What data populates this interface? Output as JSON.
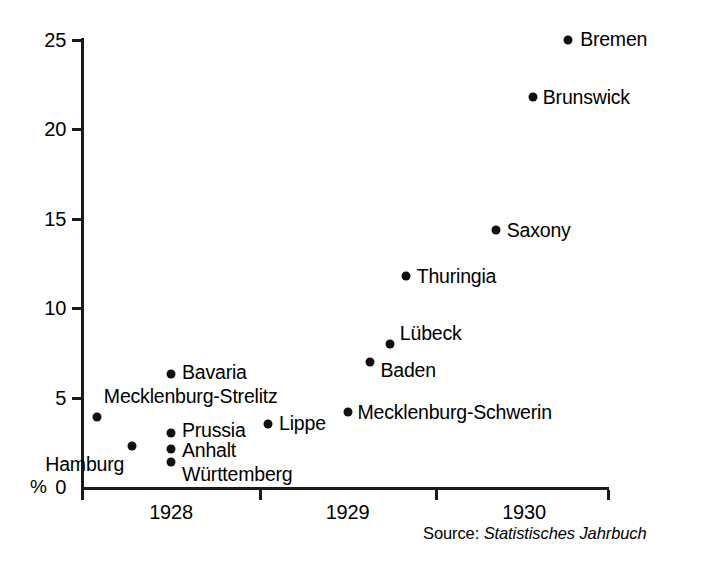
{
  "chart_data": {
    "type": "scatter",
    "title": "",
    "xlabel": "",
    "ylabel": "%",
    "xlim": [
      1927.5,
      1930.5
    ],
    "ylim": [
      0,
      25
    ],
    "grid": false,
    "legend": null,
    "y_ticks": [
      "25",
      "20",
      "15",
      "10",
      "5",
      "0"
    ],
    "y_tick_values": [
      25,
      20,
      15,
      10,
      5,
      0
    ],
    "x_ticks": [
      "1928",
      "1929",
      "1930"
    ],
    "x_tick_values": [
      1928,
      1929,
      1930
    ],
    "unit_label": "%",
    "points": [
      {
        "label": "Bremen",
        "x": 1930.25,
        "y": 25.0
      },
      {
        "label": "Brunswick",
        "x": 1930.05,
        "y": 21.8
      },
      {
        "label": "Saxony",
        "x": 1929.84,
        "y": 14.4
      },
      {
        "label": "Thuringia",
        "x": 1929.33,
        "y": 11.8
      },
      {
        "label": "Lübeck",
        "x": 1929.24,
        "y": 8.0
      },
      {
        "label": "Baden",
        "x": 1929.13,
        "y": 7.0
      },
      {
        "label": "Bavaria",
        "x": 1928.0,
        "y": 6.3
      },
      {
        "label": "Mecklenburg-Schwerin",
        "x": 1929.0,
        "y": 4.2
      },
      {
        "label": "Mecklenburg-Strelitz",
        "x": 1927.58,
        "y": 3.9
      },
      {
        "label": "Lippe",
        "x": 1928.55,
        "y": 3.5
      },
      {
        "label": "Prussia",
        "x": 1928.0,
        "y": 3.0
      },
      {
        "label": "Hamburg",
        "x": 1927.78,
        "y": 2.3
      },
      {
        "label": "Anhalt",
        "x": 1928.0,
        "y": 2.1
      },
      {
        "label": "Württemberg",
        "x": 1928.0,
        "y": 1.4
      }
    ]
  },
  "source": {
    "prefix": "Source:",
    "title": "Statistisches Jahrbuch"
  },
  "colors": {
    "ink": "#111111",
    "axis": "#1a1a1a",
    "background": "#ffffff"
  }
}
